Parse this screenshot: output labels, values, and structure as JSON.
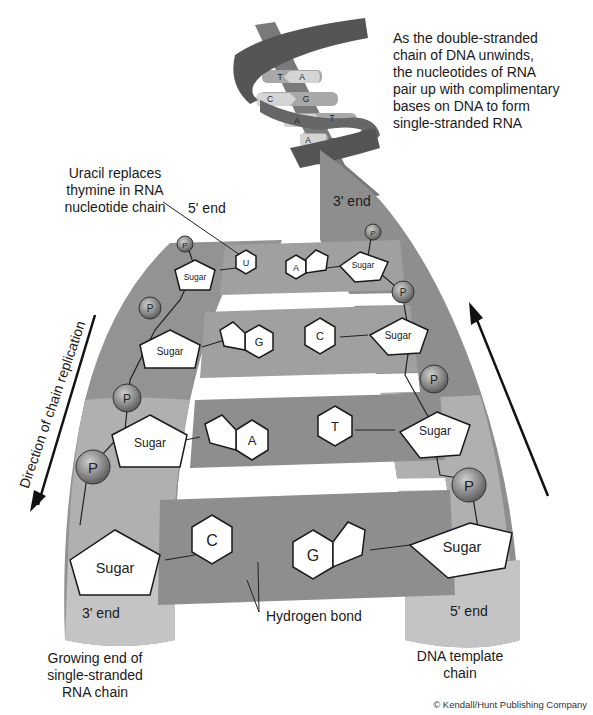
{
  "diagram": {
    "colors": {
      "strand_dark": "#5a5a5a",
      "strand_mid": "#8a8a8a",
      "strand_light": "#b4b4b4",
      "rung": "#9a9a9a",
      "rung_light": "#c8c8c8",
      "base_fill": "#ffffff",
      "phosphate": "#8c8c8c",
      "outline": "#1a1a1a"
    },
    "helix_top": {
      "base_pairs": [
        {
          "left": "T",
          "right": "A"
        },
        {
          "left": "C",
          "right": "G"
        },
        {
          "left": "A",
          "right": "T"
        },
        {
          "left": "A",
          "right": ""
        }
      ]
    },
    "annotations": {
      "intro": [
        "As the double-stranded",
        "chain of DNA unwinds,",
        "the nucleotides of RNA",
        "pair up with complimentary",
        "bases on DNA to form",
        "single-stranded RNA"
      ],
      "uracil": [
        "Uracil replaces",
        "thymine in RNA",
        "nucleotide chain"
      ],
      "left_top_end": "5' end",
      "right_top_end": "3' end",
      "left_bottom_end": "3' end",
      "right_bottom_end": "5' end",
      "direction": "Direction of chain replication",
      "hydrogen_bond": "Hydrogen bond",
      "growing_end": [
        "Growing end of",
        "single-stranded",
        "RNA chain"
      ],
      "template": [
        "DNA template",
        "chain"
      ],
      "copyright": "© Kendall/Hunt Publishing Company"
    },
    "rungs": [
      {
        "left_base": "U",
        "right_base": "A",
        "left_sugar": "Sugar",
        "right_sugar": "Sugar",
        "phosphate": "P"
      },
      {
        "left_base": "G",
        "right_base": "C",
        "left_sugar": "Sugar",
        "right_sugar": "Sugar",
        "phosphate": "P"
      },
      {
        "left_base": "A",
        "right_base": "T",
        "left_sugar": "Sugar",
        "right_sugar": "Sugar",
        "phosphate": "P"
      },
      {
        "left_base": "C",
        "right_base": "G",
        "left_sugar": "Sugar",
        "right_sugar": "Sugar",
        "phosphate": "P"
      }
    ]
  }
}
